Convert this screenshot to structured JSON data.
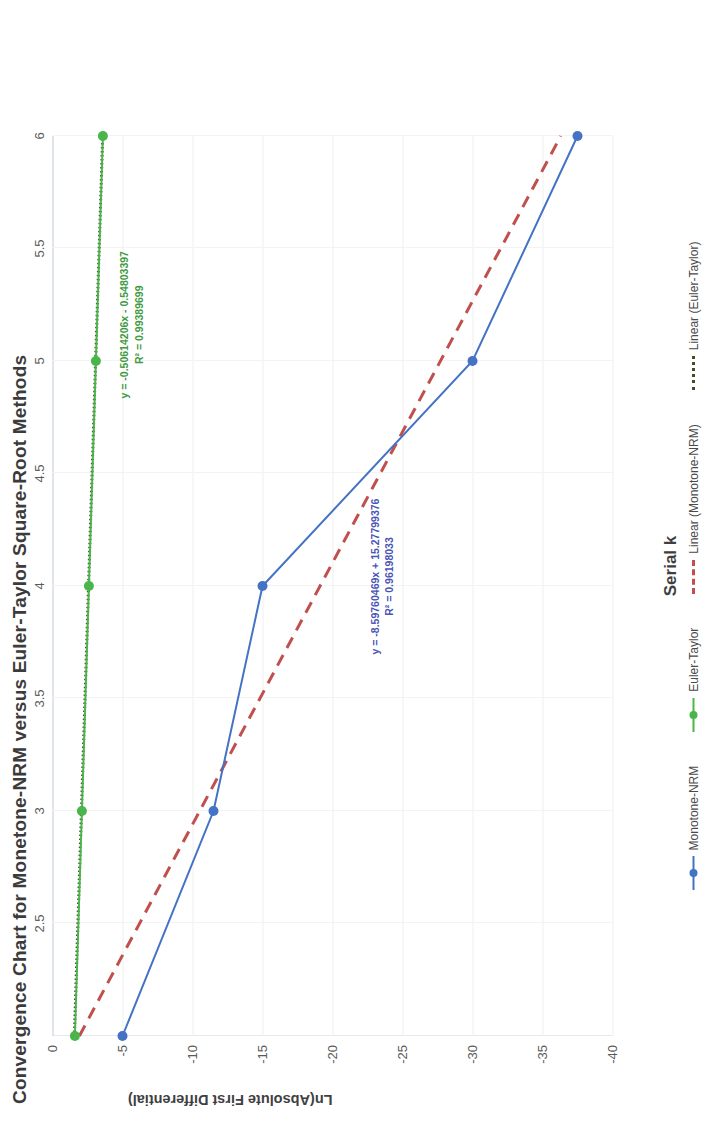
{
  "chart_data": {
    "type": "line",
    "title": "Convergence Chart for Monetone-NRM versus Euler-Taylor Square-Root Methods",
    "xlabel": "Serial k",
    "ylabel": "Ln(Absolute First Differential)",
    "xlim": [
      2,
      6
    ],
    "ylim": [
      -40,
      0
    ],
    "xticks": [
      "2.5",
      "3",
      "3.5",
      "4",
      "4.5",
      "5",
      "5.5",
      "6"
    ],
    "xtick_values": [
      2.5,
      3,
      3.5,
      4,
      4.5,
      5,
      5.5,
      6
    ],
    "yticks": [
      "0",
      "-5",
      "-10",
      "-15",
      "-20",
      "-25",
      "-30",
      "-35",
      "-40"
    ],
    "ytick_values": [
      0,
      -5,
      -10,
      -15,
      -20,
      -25,
      -30,
      -35,
      -40
    ],
    "grid": true,
    "legend_position": "bottom",
    "x": [
      2,
      3,
      4,
      5,
      6
    ],
    "series": [
      {
        "name": "Monotone-NRM",
        "color": "#4472c4",
        "style": "solid-marker",
        "values": [
          -5.0,
          -11.5,
          -15.0,
          -30.0,
          -37.5
        ]
      },
      {
        "name": "Euler-Taylor",
        "color": "#4ab54a",
        "style": "solid-marker",
        "values": [
          -1.6,
          -2.1,
          -2.6,
          -3.1,
          -3.6
        ]
      },
      {
        "name": "Linear (Monotone-NRM)",
        "color": "#c0504d",
        "style": "dashed",
        "equation": "y = -8.59760469x + 15.27799376",
        "r2": "R² = 0.96198033",
        "slope": -8.59760469,
        "intercept": 15.27799376,
        "r2_value": 0.96198033
      },
      {
        "name": "Linear (Euler-Taylor)",
        "color": "#4a4a2a",
        "style": "dotted",
        "equation": "y = -0.50614206x - 0.54803397",
        "r2": "R² = 0.99389699",
        "slope": -0.50614206,
        "intercept": -0.54803397,
        "r2_value": 0.99389699
      }
    ],
    "annotations": [
      {
        "id": "euler_taylor_fit",
        "line1": "y = -0.50614206x - 0.54803397",
        "line2": "R² = 0.99389699",
        "color": "#3f9b3f"
      },
      {
        "id": "monotone_nrm_fit",
        "line1": "y = -8.59760469x + 15.27799376",
        "line2": "R² = 0.96198033",
        "color": "#4a55b5"
      }
    ]
  },
  "legend": {
    "items": [
      {
        "label": "Monotone-NRM",
        "color": "#4472c4",
        "style": "solid-marker"
      },
      {
        "label": "Euler-Taylor",
        "color": "#4ab54a",
        "style": "solid-marker"
      },
      {
        "label": "Linear (Monotone-NRM)",
        "color": "#c0504d",
        "style": "dashed"
      },
      {
        "label": "Linear (Euler-Taylor)",
        "color": "#4a4a2a",
        "style": "dotted"
      }
    ]
  }
}
